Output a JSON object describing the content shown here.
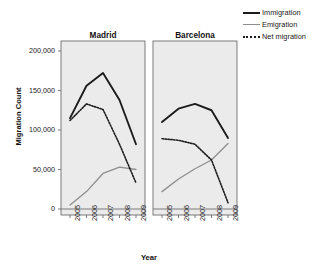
{
  "chart_data": {
    "type": "line",
    "title": "",
    "xlabel": "Year",
    "ylabel": "Migration Count",
    "x": [
      "2005",
      "2006",
      "2007",
      "2008",
      "2009"
    ],
    "ylim": [
      0,
      200000
    ],
    "yticks": [
      0,
      50000,
      100000,
      150000,
      200000
    ],
    "ytick_labels": [
      "0",
      "50,000",
      "100,000",
      "150,000",
      "200,000"
    ],
    "grid": false,
    "legend_position": "top-right",
    "panels": [
      {
        "name": "Madrid",
        "series": [
          {
            "name": "Immigration",
            "values": [
              115000,
              156000,
              172000,
              138000,
              82000
            ]
          },
          {
            "name": "Emigration",
            "values": [
              5000,
              22000,
              45000,
              53000,
              50000
            ]
          },
          {
            "name": "Net migration",
            "values": [
              112000,
              133000,
              126000,
              82000,
              33000
            ]
          }
        ]
      },
      {
        "name": "Barcelona",
        "series": [
          {
            "name": "Immigration",
            "values": [
              110000,
              127000,
              133000,
              125000,
              90000
            ]
          },
          {
            "name": "Emigration",
            "values": [
              22000,
              38000,
              51000,
              62000,
              83000
            ]
          },
          {
            "name": "Net migration",
            "values": [
              89000,
              87000,
              82000,
              62000,
              8000
            ]
          }
        ]
      }
    ]
  },
  "legend": {
    "items": [
      {
        "label": "Immigration",
        "color": "#1c1c1c",
        "style": "solid-thick"
      },
      {
        "label": "Emigration",
        "color": "#8e8e8e",
        "style": "solid-thin"
      },
      {
        "label": "Net migration",
        "color": "#1c1c1c",
        "style": "dotted"
      }
    ]
  },
  "axes": {
    "y_label": "Migration Count",
    "x_label": "Year",
    "y_ticks": [
      "200,000",
      "150,000",
      "100,000",
      "50,000",
      "0"
    ],
    "x_ticks": [
      "2005",
      "2006",
      "2007",
      "2008",
      "2009"
    ]
  },
  "panel_titles": {
    "left": "Madrid",
    "right": "Barcelona"
  },
  "colors": {
    "panel_background": "#ebebeb",
    "panel_border": "#6e6e6e",
    "immigration": "#1c1c1c",
    "emigration": "#8e8e8e",
    "net_migration": "#1c1c1c",
    "axis_text": "#1a1a1a"
  }
}
